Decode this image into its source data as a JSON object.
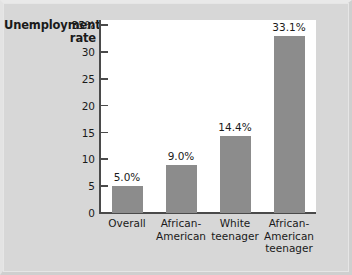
{
  "chart_data": {
    "type": "bar",
    "title": "Unemployment rate",
    "title_lines": [
      "Unemployment",
      "rate"
    ],
    "xlabel": "",
    "ylabel": "Unemployment rate",
    "ylim": [
      0,
      36
    ],
    "grid": false,
    "legend": "none",
    "bar_color": "#8c8c8c",
    "axis_color": "#4a4a4a",
    "plot_background": "#ffffff",
    "figure_background": "#d7d7d7",
    "categories": [
      "Overall",
      "African-American",
      "White teenager",
      "African-American teenager"
    ],
    "category_lines": [
      [
        "Overall"
      ],
      [
        "African-",
        "American"
      ],
      [
        "White",
        "teenager"
      ],
      [
        "African-",
        "American",
        "teenager"
      ]
    ],
    "values": [
      5.0,
      9.0,
      14.4,
      33.1
    ],
    "value_labels": [
      "5.0%",
      "9.0%",
      "14.4%",
      "33.1%"
    ],
    "yticks": [
      35,
      30,
      25,
      20,
      15,
      10,
      5,
      0
    ],
    "ytick_labels": [
      "35%",
      "30",
      "25",
      "20",
      "15",
      "10",
      "5",
      "0"
    ]
  }
}
